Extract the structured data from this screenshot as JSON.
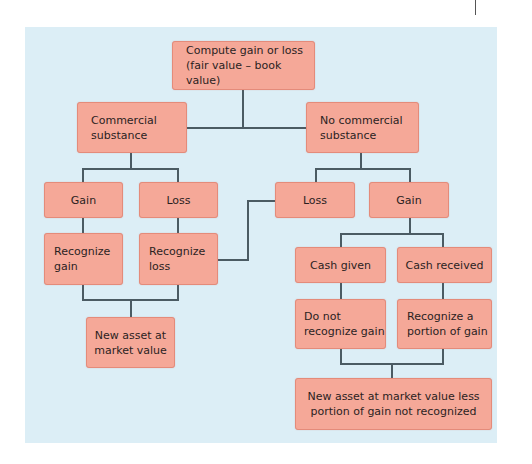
{
  "diagram": {
    "type": "flowchart",
    "colors": {
      "panel": "#dceef6",
      "box_fill": "#f5a898",
      "box_border": "#e48b7a",
      "connector": "#4b5b63",
      "text": "#2b1f1f"
    },
    "nodes": {
      "root": "Compute gain or loss\n(fair value – book value)",
      "commercial": "Commercial\nsubstance",
      "no_commercial": "No commercial\nsubstance",
      "cs_gain": "Gain",
      "cs_loss": "Loss",
      "cs_recognize_gain": "Recognize\ngain",
      "cs_recognize_loss": "Recognize\nloss",
      "cs_new_asset": "New asset at\nmarket value",
      "ncs_loss": "Loss",
      "ncs_gain": "Gain",
      "cash_given": "Cash given",
      "cash_received": "Cash received",
      "do_not_recognize": "Do not\nrecognize gain",
      "recognize_portion": "Recognize a\nportion of gain",
      "ncs_new_asset": "New asset at market value less\nportion of gain not recognized"
    },
    "edges": [
      [
        "root",
        "commercial"
      ],
      [
        "root",
        "no_commercial"
      ],
      [
        "commercial",
        "cs_gain"
      ],
      [
        "commercial",
        "cs_loss"
      ],
      [
        "cs_gain",
        "cs_recognize_gain"
      ],
      [
        "cs_loss",
        "cs_recognize_loss"
      ],
      [
        "cs_recognize_gain",
        "cs_new_asset"
      ],
      [
        "cs_recognize_loss",
        "cs_new_asset"
      ],
      [
        "no_commercial",
        "ncs_loss"
      ],
      [
        "no_commercial",
        "ncs_gain"
      ],
      [
        "ncs_loss",
        "cs_recognize_loss"
      ],
      [
        "ncs_gain",
        "cash_given"
      ],
      [
        "ncs_gain",
        "cash_received"
      ],
      [
        "cash_given",
        "do_not_recognize"
      ],
      [
        "cash_received",
        "recognize_portion"
      ],
      [
        "do_not_recognize",
        "ncs_new_asset"
      ],
      [
        "recognize_portion",
        "ncs_new_asset"
      ]
    ]
  }
}
